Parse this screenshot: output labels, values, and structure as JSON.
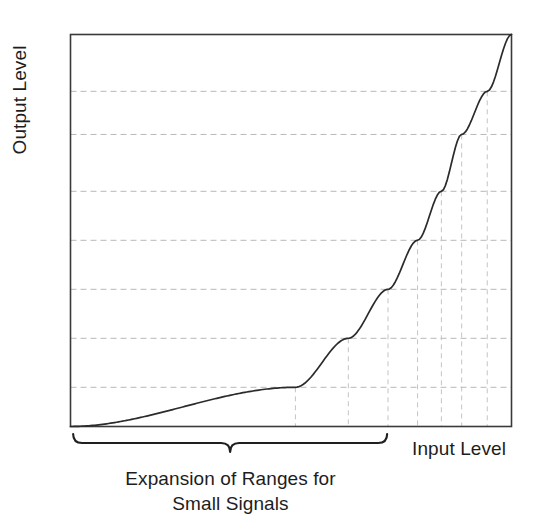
{
  "figure": {
    "title": "",
    "axis_labels": {
      "y": "Output Level",
      "x": "Input Level"
    },
    "bracket_caption_line1": "Expansion of Ranges for",
    "bracket_caption_line2": "Small Signals",
    "colors": {
      "curve": "#2b2b2b",
      "frame": "#3a3a3a",
      "gridline": "#b8b8b8",
      "dropline": "#c4c4c4",
      "bracket": "#1f1f1f",
      "text": "#1d1d1d",
      "background": "#ffffff"
    }
  },
  "chart_data": {
    "type": "line",
    "title": "",
    "xlabel": "Input Level",
    "ylabel": "Output Level",
    "xlim": [
      0,
      1
    ],
    "ylim": [
      0,
      1
    ],
    "grid": true,
    "legend": false,
    "y_gridlines": [
      0.1,
      0.225,
      0.35,
      0.475,
      0.6,
      0.745,
      0.855
    ],
    "dropline_x": [
      0.51,
      0.63,
      0.72,
      0.787,
      0.841,
      0.887,
      0.945
    ],
    "series": [
      {
        "name": "Transfer Curve",
        "x": [
          0.0,
          0.05,
          0.1,
          0.15,
          0.17,
          0.2,
          0.25,
          0.3,
          0.35,
          0.4,
          0.45,
          0.51,
          0.55,
          0.6,
          0.63,
          0.67,
          0.72,
          0.76,
          0.787,
          0.82,
          0.841,
          0.87,
          0.887,
          0.91,
          0.945,
          0.97,
          1.0
        ],
        "y": [
          0.0,
          0.002,
          0.004,
          0.007,
          0.009,
          0.013,
          0.025,
          0.042,
          0.063,
          0.09,
          0.122,
          0.1,
          0.186,
          0.236,
          0.225,
          0.295,
          0.35,
          0.42,
          0.475,
          0.545,
          0.6,
          0.68,
          0.745,
          0.8,
          0.855,
          0.93,
          1.0
        ]
      }
    ],
    "bracket": {
      "x_start": 0.006,
      "x_end": 0.718,
      "label": "Expansion of Ranges for Small Signals"
    }
  }
}
